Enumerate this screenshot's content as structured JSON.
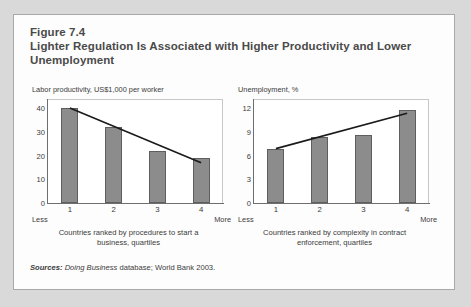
{
  "figure": {
    "number": "Figure 7.4",
    "title": "Lighter Regulation Is Associated with Higher Productivity and Lower Unemployment",
    "sources_lead": "Sources:",
    "sources_italic": "Doing Business",
    "sources_rest": " database; World Bank 2003."
  },
  "chart_data": [
    {
      "type": "bar",
      "title": "Labor productivity, US$1,000 per worker",
      "ylabel": "Labor productivity, US$1,000 per worker",
      "xlabel": "Countries ranked by procedures to start a business, quartiles",
      "caption_line1": "Countries ranked by procedures to start a",
      "caption_line2": "business, quartiles",
      "categories": [
        "1",
        "2",
        "3",
        "4"
      ],
      "values": [
        40,
        32,
        22,
        19
      ],
      "yticks": [
        0,
        10,
        20,
        30,
        40
      ],
      "ylim": [
        0,
        44
      ],
      "axis_start_label": "Less",
      "axis_end_label": "More",
      "grid": false,
      "legend": "none",
      "trendline": {
        "x0": 1,
        "y0": 40.2,
        "x1": 4,
        "y1": 17.0
      },
      "bar_color": "#8c8c8c",
      "line_color": "#1a1a1a"
    },
    {
      "type": "bar",
      "title": "Unemployment, %",
      "ylabel": "Unemployment, %",
      "xlabel": "Countries ranked by complexity in contract enforcement, quartiles",
      "caption_line1": "Countries ranked by complexity in contract",
      "caption_line2": "enforcement, quartiles",
      "categories": [
        "1",
        "2",
        "3",
        "4"
      ],
      "values": [
        6.8,
        8.4,
        8.6,
        11.8
      ],
      "yticks": [
        0,
        3,
        6,
        9,
        12
      ],
      "ylim": [
        0,
        13.2
      ],
      "axis_start_label": "Less",
      "axis_end_label": "More",
      "grid": false,
      "legend": "none",
      "trendline": {
        "x0": 1,
        "y0": 6.9,
        "x1": 4,
        "y1": 11.4
      },
      "bar_color": "#8c8c8c",
      "line_color": "#1a1a1a"
    }
  ]
}
